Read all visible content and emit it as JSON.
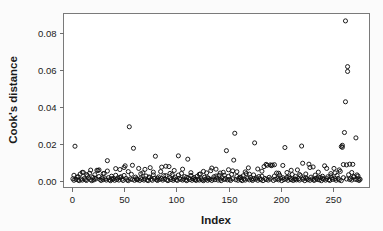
{
  "chart_data": {
    "type": "scatter",
    "title": "",
    "xlabel": "Index",
    "ylabel": "Cook's distance",
    "xlim": [
      -8,
      285
    ],
    "ylim": [
      -0.0035,
      0.0905
    ],
    "xticks": [
      0,
      50,
      100,
      150,
      200,
      250
    ],
    "xtick_labels": [
      "0",
      "50",
      "100",
      "150",
      "200",
      "250"
    ],
    "yticks": [
      0.0,
      0.02,
      0.04,
      0.06,
      0.08
    ],
    "ytick_labels": [
      "0.00",
      "0.02",
      "0.04",
      "0.06",
      "0.08"
    ],
    "grid": false,
    "legend": null,
    "marker": "open-circle",
    "marker_color": "#111111",
    "point_count": 276,
    "annotations": [],
    "notable_outliers": [
      {
        "x": 262,
        "y": 0.0865
      },
      {
        "x": 264,
        "y": 0.0618
      },
      {
        "x": 264,
        "y": 0.0592
      },
      {
        "x": 262,
        "y": 0.0428
      },
      {
        "x": 55,
        "y": 0.0293
      },
      {
        "x": 156,
        "y": 0.0258
      },
      {
        "x": 261,
        "y": 0.0262
      },
      {
        "x": 272,
        "y": 0.0233
      },
      {
        "x": 175,
        "y": 0.0206
      },
      {
        "x": 3,
        "y": 0.0188
      },
      {
        "x": 220,
        "y": 0.0189
      },
      {
        "x": 204,
        "y": 0.0181
      },
      {
        "x": 259,
        "y": 0.0193
      },
      {
        "x": 259,
        "y": 0.0182
      },
      {
        "x": 59,
        "y": 0.0177
      },
      {
        "x": 148,
        "y": 0.0164
      }
    ],
    "points": [
      [
        1,
        0.0012
      ],
      [
        2,
        0.0004
      ],
      [
        3,
        0.0188
      ],
      [
        4,
        0.0009
      ],
      [
        5,
        0.0021
      ],
      [
        6,
        0.0006
      ],
      [
        7,
        0.0002
      ],
      [
        8,
        0.0038
      ],
      [
        9,
        0.0011
      ],
      [
        10,
        0.0005
      ],
      [
        11,
        0.0046
      ],
      [
        12,
        0.0013
      ],
      [
        13,
        0.0007
      ],
      [
        14,
        0.0003
      ],
      [
        15,
        0.0029
      ],
      [
        16,
        0.0016
      ],
      [
        17,
        0.0042
      ],
      [
        18,
        0.0008
      ],
      [
        19,
        0.0002
      ],
      [
        20,
        0.0019
      ],
      [
        21,
        0.0006
      ],
      [
        22,
        0.0034
      ],
      [
        23,
        0.0011
      ],
      [
        24,
        0.0058
      ],
      [
        25,
        0.0057
      ],
      [
        26,
        0.0024
      ],
      [
        27,
        0.0009
      ],
      [
        28,
        0.0003
      ],
      [
        29,
        0.0015
      ],
      [
        30,
        0.0007
      ],
      [
        31,
        0.0041
      ],
      [
        32,
        0.0012
      ],
      [
        33,
        0.0005
      ],
      [
        34,
        0.011
      ],
      [
        35,
        0.0018
      ],
      [
        36,
        0.0006
      ],
      [
        37,
        0.0002
      ],
      [
        38,
        0.0026
      ],
      [
        39,
        0.0009
      ],
      [
        40,
        0.0013
      ],
      [
        41,
        0.0004
      ],
      [
        42,
        0.0031
      ],
      [
        43,
        0.0008
      ],
      [
        44,
        0.0017
      ],
      [
        45,
        0.0005
      ],
      [
        46,
        0.0062
      ],
      [
        47,
        0.0023
      ],
      [
        48,
        0.001
      ],
      [
        49,
        0.0003
      ],
      [
        50,
        0.0073
      ],
      [
        51,
        0.0082
      ],
      [
        52,
        0.0014
      ],
      [
        53,
        0.0006
      ],
      [
        54,
        0.0002
      ],
      [
        55,
        0.0293
      ],
      [
        56,
        0.0011
      ],
      [
        57,
        0.0036
      ],
      [
        58,
        0.0008
      ],
      [
        59,
        0.0177
      ],
      [
        60,
        0.0004
      ],
      [
        61,
        0.0021
      ],
      [
        62,
        0.0013
      ],
      [
        63,
        0.0007
      ],
      [
        64,
        0.0068
      ],
      [
        65,
        0.0003
      ],
      [
        66,
        0.0016
      ],
      [
        67,
        0.0009
      ],
      [
        68,
        0.0044
      ],
      [
        69,
        0.0005
      ],
      [
        70,
        0.0012
      ],
      [
        71,
        0.0027
      ],
      [
        72,
        0.0006
      ],
      [
        73,
        0.0002
      ],
      [
        74,
        0.0018
      ],
      [
        75,
        0.0072
      ],
      [
        76,
        0.001
      ],
      [
        77,
        0.0004
      ],
      [
        78,
        0.0033
      ],
      [
        79,
        0.0014
      ],
      [
        80,
        0.0134
      ],
      [
        81,
        0.0007
      ],
      [
        82,
        0.0003
      ],
      [
        83,
        0.0022
      ],
      [
        84,
        0.0009
      ],
      [
        85,
        0.0051
      ],
      [
        86,
        0.0013
      ],
      [
        87,
        0.0005
      ],
      [
        88,
        0.0029
      ],
      [
        89,
        0.0011
      ],
      [
        90,
        0.008
      ],
      [
        91,
        0.0006
      ],
      [
        92,
        0.0002
      ],
      [
        93,
        0.0078
      ],
      [
        94,
        0.0017
      ],
      [
        95,
        0.0008
      ],
      [
        96,
        0.0035
      ],
      [
        97,
        0.0004
      ],
      [
        98,
        0.0012
      ],
      [
        99,
        0.0021
      ],
      [
        100,
        0.0007
      ],
      [
        101,
        0.0003
      ],
      [
        102,
        0.0136
      ],
      [
        103,
        0.0015
      ],
      [
        104,
        0.0009
      ],
      [
        105,
        0.0041
      ],
      [
        106,
        0.0005
      ],
      [
        107,
        0.0011
      ],
      [
        108,
        0.0024
      ],
      [
        109,
        0.0006
      ],
      [
        110,
        0.0002
      ],
      [
        111,
        0.0118
      ],
      [
        112,
        0.0016
      ],
      [
        113,
        0.0008
      ],
      [
        114,
        0.003
      ],
      [
        115,
        0.0004
      ],
      [
        116,
        0.0013
      ],
      [
        117,
        0.0019
      ],
      [
        118,
        0.0007
      ],
      [
        119,
        0.0003
      ],
      [
        120,
        0.0026
      ],
      [
        121,
        0.001
      ],
      [
        122,
        0.0005
      ],
      [
        123,
        0.0038
      ],
      [
        124,
        0.0012
      ],
      [
        125,
        0.0006
      ],
      [
        126,
        0.0002
      ],
      [
        127,
        0.002
      ],
      [
        128,
        0.0009
      ],
      [
        129,
        0.0044
      ],
      [
        130,
        0.0004
      ],
      [
        131,
        0.0014
      ],
      [
        132,
        0.0008
      ],
      [
        133,
        0.0056
      ],
      [
        134,
        0.0003
      ],
      [
        135,
        0.0011
      ],
      [
        136,
        0.0023
      ],
      [
        137,
        0.0007
      ],
      [
        138,
        0.0064
      ],
      [
        139,
        0.0016
      ],
      [
        140,
        0.0005
      ],
      [
        141,
        0.0031
      ],
      [
        142,
        0.001
      ],
      [
        143,
        0.0002
      ],
      [
        144,
        0.0018
      ],
      [
        145,
        0.0047
      ],
      [
        146,
        0.0008
      ],
      [
        147,
        0.0013
      ],
      [
        148,
        0.0164
      ],
      [
        149,
        0.0006
      ],
      [
        150,
        0.0025
      ],
      [
        151,
        0.0009
      ],
      [
        152,
        0.0003
      ],
      [
        153,
        0.0036
      ],
      [
        154,
        0.0012
      ],
      [
        155,
        0.0113
      ],
      [
        156,
        0.0258
      ],
      [
        157,
        0.0007
      ],
      [
        158,
        0.005
      ],
      [
        159,
        0.0004
      ],
      [
        160,
        0.0015
      ],
      [
        161,
        0.0021
      ],
      [
        162,
        0.0008
      ],
      [
        163,
        0.0002
      ],
      [
        164,
        0.0028
      ],
      [
        165,
        0.0011
      ],
      [
        166,
        0.0005
      ],
      [
        167,
        0.004
      ],
      [
        168,
        0.0013
      ],
      [
        169,
        0.0071
      ],
      [
        170,
        0.0006
      ],
      [
        171,
        0.0019
      ],
      [
        172,
        0.0009
      ],
      [
        173,
        0.0003
      ],
      [
        174,
        0.0033
      ],
      [
        175,
        0.0206
      ],
      [
        176,
        0.001
      ],
      [
        177,
        0.0017
      ],
      [
        178,
        0.0004
      ],
      [
        179,
        0.0024
      ],
      [
        180,
        0.0012
      ],
      [
        181,
        0.0007
      ],
      [
        182,
        0.0053
      ],
      [
        183,
        0.0002
      ],
      [
        184,
        0.0078
      ],
      [
        185,
        0.0014
      ],
      [
        186,
        0.0008
      ],
      [
        187,
        0.0085
      ],
      [
        188,
        0.0005
      ],
      [
        189,
        0.002
      ],
      [
        190,
        0.0011
      ],
      [
        191,
        0.0083
      ],
      [
        192,
        0.0086
      ],
      [
        193,
        0.0003
      ],
      [
        194,
        0.0027
      ],
      [
        195,
        0.0009
      ],
      [
        196,
        0.0043
      ],
      [
        197,
        0.0013
      ],
      [
        198,
        0.0006
      ],
      [
        199,
        0.0031
      ],
      [
        200,
        0.0016
      ],
      [
        201,
        0.0002
      ],
      [
        202,
        0.0018
      ],
      [
        203,
        0.0008
      ],
      [
        204,
        0.0181
      ],
      [
        205,
        0.0011
      ],
      [
        206,
        0.0046
      ],
      [
        207,
        0.0004
      ],
      [
        208,
        0.0022
      ],
      [
        209,
        0.0014
      ],
      [
        210,
        0.0007
      ],
      [
        211,
        0.0035
      ],
      [
        212,
        0.0003
      ],
      [
        213,
        0.001
      ],
      [
        214,
        0.0025
      ],
      [
        215,
        0.0006
      ],
      [
        216,
        0.006
      ],
      [
        217,
        0.0012
      ],
      [
        218,
        0.0005
      ],
      [
        219,
        0.0029
      ],
      [
        220,
        0.0189
      ],
      [
        221,
        0.0009
      ],
      [
        222,
        0.0016
      ],
      [
        223,
        0.0002
      ],
      [
        224,
        0.0038
      ],
      [
        225,
        0.0013
      ],
      [
        226,
        0.0007
      ],
      [
        227,
        0.0091
      ],
      [
        228,
        0.0004
      ],
      [
        229,
        0.0021
      ],
      [
        230,
        0.0011
      ],
      [
        231,
        0.0076
      ],
      [
        232,
        0.0003
      ],
      [
        233,
        0.0032
      ],
      [
        234,
        0.0015
      ],
      [
        235,
        0.0008
      ],
      [
        236,
        0.0048
      ],
      [
        237,
        0.0006
      ],
      [
        238,
        0.0019
      ],
      [
        239,
        0.0002
      ],
      [
        240,
        0.0026
      ],
      [
        241,
        0.001
      ],
      [
        242,
        0.0082
      ],
      [
        243,
        0.0005
      ],
      [
        244,
        0.0013
      ],
      [
        245,
        0.0023
      ],
      [
        246,
        0.0007
      ],
      [
        247,
        0.0003
      ],
      [
        248,
        0.004
      ],
      [
        249,
        0.0017
      ],
      [
        250,
        0.0009
      ],
      [
        251,
        0.0068
      ],
      [
        252,
        0.0012
      ],
      [
        253,
        0.0004
      ],
      [
        254,
        0.003
      ],
      [
        255,
        0.0014
      ],
      [
        256,
        0.0006
      ],
      [
        257,
        0.0052
      ],
      [
        258,
        0.0002
      ],
      [
        259,
        0.0193
      ],
      [
        260,
        0.0018
      ],
      [
        261,
        0.0262
      ],
      [
        262,
        0.0865
      ],
      [
        263,
        0.0011
      ],
      [
        264,
        0.0618
      ],
      [
        265,
        0.0034
      ],
      [
        266,
        0.0008
      ],
      [
        267,
        0.0015
      ],
      [
        268,
        0.0005
      ],
      [
        269,
        0.009
      ],
      [
        270,
        0.0022
      ],
      [
        271,
        0.001
      ],
      [
        272,
        0.0233
      ],
      [
        273,
        0.0007
      ],
      [
        274,
        0.0027
      ],
      [
        275,
        0.0003
      ],
      [
        276,
        0.0009
      ],
      [
        259,
        0.0182
      ],
      [
        262,
        0.0428
      ],
      [
        264,
        0.0592
      ],
      [
        258,
        0.0186
      ],
      [
        260,
        0.0089
      ],
      [
        263,
        0.0087
      ],
      [
        266,
        0.0091
      ],
      [
        268,
        0.0046
      ],
      [
        270,
        0.0024
      ],
      [
        273,
        0.0033
      ],
      [
        275,
        0.0012
      ],
      [
        256,
        0.006
      ],
      [
        252,
        0.0044
      ],
      [
        248,
        0.0028
      ],
      [
        244,
        0.0068
      ],
      [
        240,
        0.0014
      ],
      [
        236,
        0.0021
      ],
      [
        232,
        0.0009
      ],
      [
        228,
        0.0073
      ],
      [
        224,
        0.0017
      ],
      [
        221,
        0.0096
      ],
      [
        218,
        0.0035
      ],
      [
        214,
        0.0011
      ],
      [
        210,
        0.0058
      ],
      [
        206,
        0.002
      ],
      [
        202,
        0.0084
      ],
      [
        198,
        0.0042
      ],
      [
        194,
        0.0088
      ],
      [
        190,
        0.0087
      ],
      [
        186,
        0.009
      ],
      [
        182,
        0.0026
      ],
      [
        178,
        0.0065
      ],
      [
        174,
        0.0012
      ],
      [
        170,
        0.0037
      ],
      [
        166,
        0.0049
      ],
      [
        162,
        0.0019
      ],
      [
        158,
        0.0025
      ],
      [
        154,
        0.0055
      ],
      [
        150,
        0.0061
      ],
      [
        146,
        0.0031
      ],
      [
        142,
        0.0043
      ],
      [
        138,
        0.0027
      ],
      [
        134,
        0.007
      ],
      [
        130,
        0.0018
      ],
      [
        126,
        0.0052
      ],
      [
        122,
        0.0036
      ],
      [
        118,
        0.001
      ],
      [
        114,
        0.0045
      ],
      [
        110,
        0.002
      ],
      [
        106,
        0.0064
      ],
      [
        102,
        0.0032
      ],
      [
        98,
        0.0057
      ],
      [
        94,
        0.0041
      ],
      [
        90,
        0.0029
      ],
      [
        86,
        0.0075
      ],
      [
        82,
        0.0015
      ],
      [
        78,
        0.0048
      ],
      [
        74,
        0.0022
      ],
      [
        70,
        0.0063
      ],
      [
        66,
        0.0039
      ],
      [
        62,
        0.0008
      ],
      [
        58,
        0.0085
      ],
      [
        54,
        0.0051
      ],
      [
        50,
        0.003
      ],
      [
        46,
        0.0019
      ],
      [
        42,
        0.0067
      ],
      [
        38,
        0.0013
      ],
      [
        34,
        0.0054
      ],
      [
        30,
        0.004
      ],
      [
        26,
        0.006
      ],
      [
        22,
        0.0016
      ],
      [
        18,
        0.0059
      ],
      [
        14,
        0.0035
      ],
      [
        10,
        0.0047
      ],
      [
        6,
        0.0023
      ],
      [
        2,
        0.0031
      ]
    ]
  }
}
